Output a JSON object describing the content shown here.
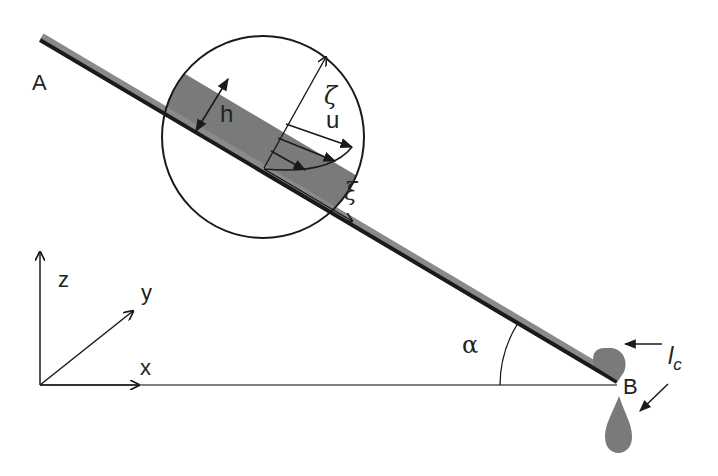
{
  "diagram": {
    "type": "thin film flow on inclined plane",
    "labels": {
      "point_a": "A",
      "point_b": "B",
      "film_thickness": "h",
      "normal_coord": "ζ",
      "velocity": "u",
      "tangential_coord": "ξ",
      "angle": "α",
      "axis_x": "x",
      "axis_y": "y",
      "axis_z": "z",
      "contact_length_main": "l",
      "contact_length_sub": "c"
    },
    "colors": {
      "background": "#ffffff",
      "line": "#1a1a1a",
      "fluid": "#7a7a7a",
      "plate_shadow": "#8a8a8a"
    }
  }
}
